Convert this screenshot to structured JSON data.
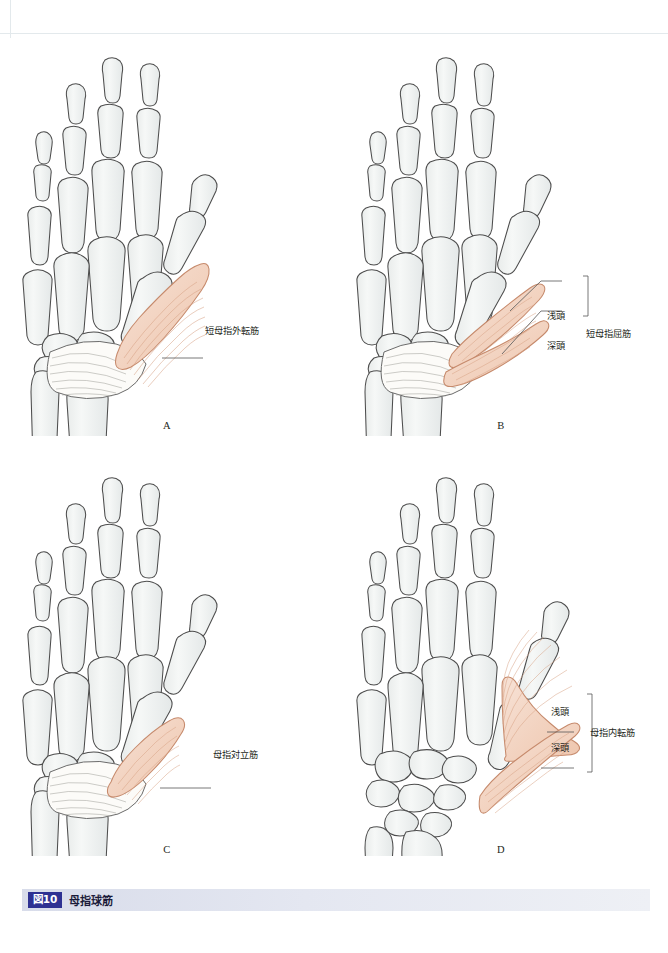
{
  "figure": {
    "caption_number": "図10",
    "caption_title": "母指球筋"
  },
  "colors": {
    "bone_fill": "#f1f3f3",
    "bone_stroke": "#4d4d4d",
    "muscle_fill": "#f4d8c8",
    "muscle_stroke": "#c98c6d",
    "muscle_striation": "#d9a98e",
    "retinaculum_fill": "#fbfaf7",
    "retinaculum_stroke": "#6e6e6e",
    "leader_line": "#555555",
    "caption_badge": "#2e3192",
    "caption_bar": "#dfe3ee"
  },
  "panels": [
    {
      "letter": "A",
      "muscle_name": "短母指外転筋",
      "labels": [
        {
          "text": "短母指外転筋",
          "x": 205,
          "y": 296
        }
      ],
      "group_label": null
    },
    {
      "letter": "B",
      "muscle_name": "短母指屈筋",
      "labels": [
        {
          "text": "浅頭",
          "x": 547,
          "y": 281
        },
        {
          "text": "深頭",
          "x": 547,
          "y": 311
        }
      ],
      "group_label": {
        "text": "短母指屈筋",
        "x": 586,
        "y": 296
      }
    },
    {
      "letter": "C",
      "muscle_name": "母指対立筋",
      "labels": [
        {
          "text": "母指対立筋",
          "x": 213,
          "y": 722
        }
      ],
      "group_label": null
    },
    {
      "letter": "D",
      "muscle_name": "母指内転筋",
      "labels": [
        {
          "text": "浅頭",
          "x": 551,
          "y": 678
        },
        {
          "text": "深頭",
          "x": 551,
          "y": 714
        }
      ],
      "group_label": {
        "text": "母指内転筋",
        "x": 590,
        "y": 696
      }
    }
  ]
}
